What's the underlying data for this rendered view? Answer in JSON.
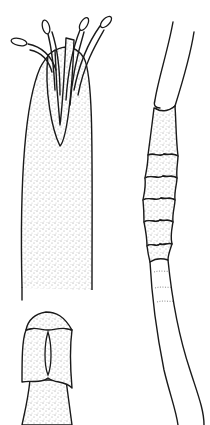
{
  "figure": {
    "type": "scientific line illustration",
    "background": "#ffffff",
    "ink_color": "#1a1a1a",
    "panels": [
      {
        "id": "polyp-with-tentacles",
        "position": "top-left",
        "description": "stippled elongated body with four protruding tentacles with pale tips"
      },
      {
        "id": "segment-detail",
        "position": "bottom-left",
        "description": "stippled collar segment with slit-like aperture"
      },
      {
        "id": "annulated-stalk",
        "position": "right",
        "description": "long stalk with stippled overlapping annular rings transitioning into smooth tube"
      }
    ]
  }
}
